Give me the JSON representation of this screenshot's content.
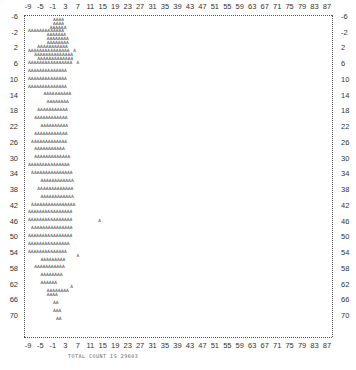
{
  "chart_data": {
    "type": "scatter",
    "title": "",
    "xlabel": "",
    "ylabel": "",
    "x_ticks": [
      -9,
      -5,
      -1,
      3,
      7,
      11,
      15,
      19,
      23,
      27,
      31,
      35,
      39,
      43,
      47,
      51,
      55,
      59,
      63,
      67,
      71,
      75,
      79,
      83,
      87
    ],
    "y_ticks": [
      -6,
      -2,
      2,
      6,
      10,
      14,
      18,
      22,
      26,
      30,
      34,
      38,
      42,
      46,
      50,
      54,
      58,
      62,
      66,
      70
    ],
    "xlim": [
      -10,
      89
    ],
    "ylim": [
      -6,
      73
    ],
    "y_inverted": true,
    "grid": false,
    "marker": "A",
    "style": "line-printer character plot",
    "footer": "TOTAL COUNT IS 29603",
    "rows": [
      {
        "y": -5,
        "x_range": [
          -1,
          3
        ]
      },
      {
        "y": -4,
        "x_range": [
          -1,
          3
        ]
      },
      {
        "y": -3,
        "x_range": [
          -2,
          4
        ]
      },
      {
        "y": -2,
        "x_range": [
          -9,
          4
        ]
      },
      {
        "y": -1,
        "x_range": [
          -3,
          4
        ]
      },
      {
        "y": 0,
        "x_range": [
          -3,
          5
        ]
      },
      {
        "y": 1,
        "x_range": [
          -3,
          5
        ]
      },
      {
        "y": 2,
        "x_range": [
          -6,
          5
        ]
      },
      {
        "y": 3,
        "x_range": [
          -9,
          6
        ]
      },
      {
        "y": 4,
        "x_range": [
          -7,
          7
        ]
      },
      {
        "y": 5,
        "x_range": [
          -6,
          7
        ]
      },
      {
        "y": 6,
        "x_range": [
          -9,
          7
        ]
      },
      {
        "y": 8,
        "x_range": [
          -9,
          5
        ]
      },
      {
        "y": 10,
        "x_range": [
          -9,
          5
        ]
      },
      {
        "y": 12,
        "x_range": [
          -9,
          5
        ]
      },
      {
        "y": 14,
        "x_range": [
          -4,
          6
        ]
      },
      {
        "y": 16,
        "x_range": [
          -3,
          5
        ]
      },
      {
        "y": 18,
        "x_range": [
          -6,
          5
        ]
      },
      {
        "y": 20,
        "x_range": [
          -7,
          5
        ]
      },
      {
        "y": 22,
        "x_range": [
          -5,
          5
        ]
      },
      {
        "y": 24,
        "x_range": [
          -7,
          5
        ]
      },
      {
        "y": 26,
        "x_range": [
          -8,
          5
        ]
      },
      {
        "y": 28,
        "x_range": [
          -7,
          4
        ]
      },
      {
        "y": 30,
        "x_range": [
          -7,
          6
        ]
      },
      {
        "y": 32,
        "x_range": [
          -9,
          6
        ]
      },
      {
        "y": 34,
        "x_range": [
          -8,
          7
        ]
      },
      {
        "y": 36,
        "x_range": [
          -5,
          7
        ]
      },
      {
        "y": 38,
        "x_range": [
          -6,
          7
        ]
      },
      {
        "y": 40,
        "x_range": [
          -5,
          7
        ]
      },
      {
        "y": 42,
        "x_range": [
          -8,
          8
        ]
      },
      {
        "y": 44,
        "x_range": [
          -9,
          7
        ]
      },
      {
        "y": 46,
        "x_range": [
          -9,
          7
        ]
      },
      {
        "y": 48,
        "x_range": [
          -8,
          7
        ]
      },
      {
        "y": 50,
        "x_range": [
          -9,
          7
        ]
      },
      {
        "y": 52,
        "x_range": [
          -9,
          6
        ]
      },
      {
        "y": 54,
        "x_range": [
          -9,
          5
        ]
      },
      {
        "y": 56,
        "x_range": [
          -5,
          4
        ]
      },
      {
        "y": 58,
        "x_range": [
          -7,
          4
        ]
      },
      {
        "y": 60,
        "x_range": [
          -5,
          3
        ]
      },
      {
        "y": 62,
        "x_range": [
          -5,
          1
        ]
      },
      {
        "y": 64,
        "x_range": [
          -3,
          5
        ]
      },
      {
        "y": 65,
        "x_range": [
          -3,
          1
        ]
      },
      {
        "y": 67,
        "x_range": [
          -1,
          1
        ]
      },
      {
        "y": 69,
        "x_range": [
          -1,
          2
        ]
      },
      {
        "y": 71,
        "x_range": [
          0,
          2
        ]
      }
    ],
    "outliers": [
      {
        "x": 14,
        "y": 46
      },
      {
        "x": 7,
        "y": 55
      },
      {
        "x": 5,
        "y": 63
      },
      {
        "x": 7,
        "y": 6
      },
      {
        "x": 6,
        "y": 3
      }
    ]
  }
}
